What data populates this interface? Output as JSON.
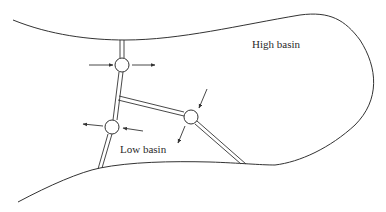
{
  "diagram": {
    "labels": {
      "high_basin": "High basin",
      "low_basin": "Low basin"
    },
    "colors": {
      "stroke": "#333333",
      "background": "#ffffff"
    },
    "junctions": [
      {
        "id": "upper-junction",
        "cx": 122,
        "cy": 65,
        "r": 7
      },
      {
        "id": "lower-junction",
        "cx": 112,
        "cy": 127,
        "r": 7
      },
      {
        "id": "right-junction",
        "cx": 191,
        "cy": 117,
        "r": 7
      }
    ]
  }
}
